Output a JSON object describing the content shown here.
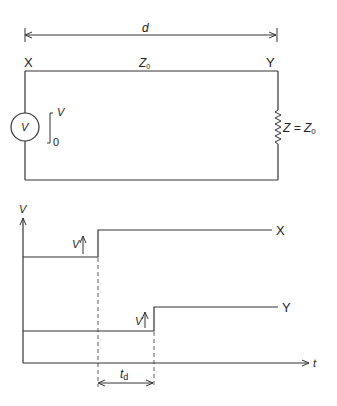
{
  "circuit": {
    "length_label": "d",
    "node_left": "X",
    "node_right": "Y",
    "line_impedance": "Z",
    "line_impedance_sub": "0",
    "source_label": "V",
    "step_high": "V",
    "step_low": "0",
    "load_label": "Z = Z",
    "load_label_sub": "0"
  },
  "graph": {
    "y_axis_label": "V",
    "x_axis_label": "t",
    "trace_x_label": "X",
    "trace_y_label": "Y",
    "step_x_label": "V",
    "step_y_label": "V",
    "delay_label": "t",
    "delay_label_sub": "d"
  },
  "colors": {
    "stroke": "#333333",
    "background": "#ffffff"
  }
}
